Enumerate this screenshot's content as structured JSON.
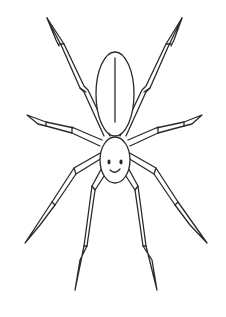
{
  "image": {
    "subject": "spider",
    "style": "line-art coloring page",
    "colors": {
      "background": "#ffffff",
      "line": "#2a2a2a"
    },
    "parts": {
      "abdomen": "elongated oval with center line",
      "head": "round face with two eyes and a smile",
      "legs": 8
    }
  }
}
